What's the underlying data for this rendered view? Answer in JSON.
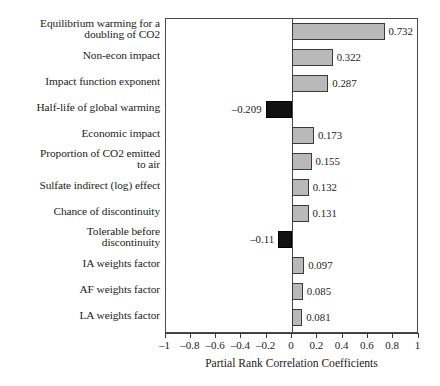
{
  "chart_data": {
    "type": "bar",
    "orientation": "horizontal",
    "title": "",
    "xlabel": "Partial Rank Correlation Coefficients",
    "ylabel": "",
    "xlim": [
      -1,
      1
    ],
    "xticks": [
      -1,
      -0.8,
      -0.6,
      -0.4,
      -0.2,
      0,
      0.2,
      0.4,
      0.6,
      0.8,
      1
    ],
    "xtick_labels": [
      "–1",
      "–0.8",
      "–0.6",
      "–0.4",
      "–0.2",
      "0",
      "0.2",
      "0.4",
      "0.6",
      "0.8",
      "1"
    ],
    "grid": false,
    "legend": null,
    "zero_line": true,
    "categories": [
      "Equilibrium warming for a doubling of CO2",
      "Non-econ impact",
      "Impact function exponent",
      "Half-life of global warming",
      "Economic impact",
      "Proportion of CO2 emitted to air",
      "Sulfate indirect (log) effect",
      "Chance of discontinuity",
      "Tolerable before discontinuity",
      "IA weights factor",
      "AF weights factor",
      "LA weights factor"
    ],
    "values": [
      0.732,
      0.322,
      0.287,
      -0.209,
      0.173,
      0.155,
      0.132,
      0.131,
      -0.11,
      0.097,
      0.085,
      0.081
    ],
    "value_labels": [
      "0.732",
      "0.322",
      "0.287",
      "–0.209",
      "0.173",
      "0.155",
      "0.132",
      "0.131",
      "–0.11",
      "0.097",
      "0.085",
      "0.081"
    ],
    "colors": {
      "positive_fill": "#b9b9b9",
      "positive_border": "#3a3a3a",
      "negative_fill": "#111111",
      "negative_border": "#000000",
      "frame": "#4a4a4a",
      "text": "#1c1c1c",
      "background": "#ffffff"
    }
  },
  "labels": {
    "rows": [
      {
        "line1": "Equilibrium warming for a",
        "line2": "doubling of CO2"
      },
      {
        "line1": "Non-econ impact",
        "line2": ""
      },
      {
        "line1": "Impact function exponent",
        "line2": ""
      },
      {
        "line1": "Half-life of global warming",
        "line2": ""
      },
      {
        "line1": "Economic impact",
        "line2": ""
      },
      {
        "line1": "Proportion of CO2 emitted",
        "line2": "to air"
      },
      {
        "line1": "Sulfate indirect (log) effect",
        "line2": ""
      },
      {
        "line1": "Chance of discontinuity",
        "line2": ""
      },
      {
        "line1": "Tolerable before",
        "line2": "discontinuity"
      },
      {
        "line1": "IA weights factor",
        "line2": ""
      },
      {
        "line1": "AF weights factor",
        "line2": ""
      },
      {
        "line1": "LA weights factor",
        "line2": ""
      }
    ]
  },
  "axis": {
    "title": "Partial Rank Correlation Coefficients",
    "tick_labels": [
      "–1",
      "–0.8",
      "–0.6",
      "–0.4",
      "–0.2",
      "0",
      "0.2",
      "0.4",
      "0.6",
      "0.8",
      "1"
    ]
  }
}
